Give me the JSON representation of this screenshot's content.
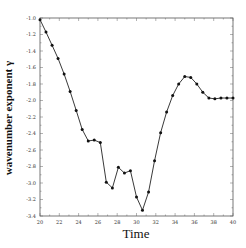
{
  "chart_data": {
    "type": "line",
    "title": "",
    "xlabel": "Time",
    "ylabel": "wavenumber exponent γ",
    "xlim": [
      20,
      40
    ],
    "ylim": [
      -3.4,
      -1.0
    ],
    "xticks": [
      20,
      22,
      24,
      26,
      28,
      30,
      32,
      34,
      36,
      38,
      40
    ],
    "yticks": [
      -1.0,
      -1.2,
      -1.4,
      -1.6,
      -1.8,
      -2.0,
      -2.2,
      -2.4,
      -2.6,
      -2.8,
      -3.0,
      -3.2,
      -3.4
    ],
    "grid": false,
    "legend": null,
    "marker": "circle",
    "series": [
      {
        "name": "gamma",
        "x": [
          20.0,
          20.62,
          21.25,
          21.87,
          22.5,
          23.12,
          23.75,
          24.37,
          25.0,
          25.62,
          26.25,
          26.87,
          27.5,
          28.12,
          28.75,
          29.37,
          30.0,
          30.62,
          31.25,
          31.87,
          32.5,
          33.12,
          33.75,
          34.37,
          35.0,
          35.62,
          36.25,
          36.87,
          37.5,
          38.12,
          38.75,
          39.37,
          40.0
        ],
        "y": [
          -1.02,
          -1.17,
          -1.33,
          -1.49,
          -1.68,
          -1.89,
          -2.12,
          -2.35,
          -2.49,
          -2.48,
          -2.51,
          -2.99,
          -3.06,
          -2.81,
          -2.88,
          -2.85,
          -3.17,
          -3.33,
          -3.11,
          -2.73,
          -2.39,
          -2.14,
          -1.94,
          -1.8,
          -1.71,
          -1.72,
          -1.8,
          -1.9,
          -1.97,
          -1.98,
          -1.97,
          -1.97,
          -1.97
        ]
      }
    ]
  }
}
